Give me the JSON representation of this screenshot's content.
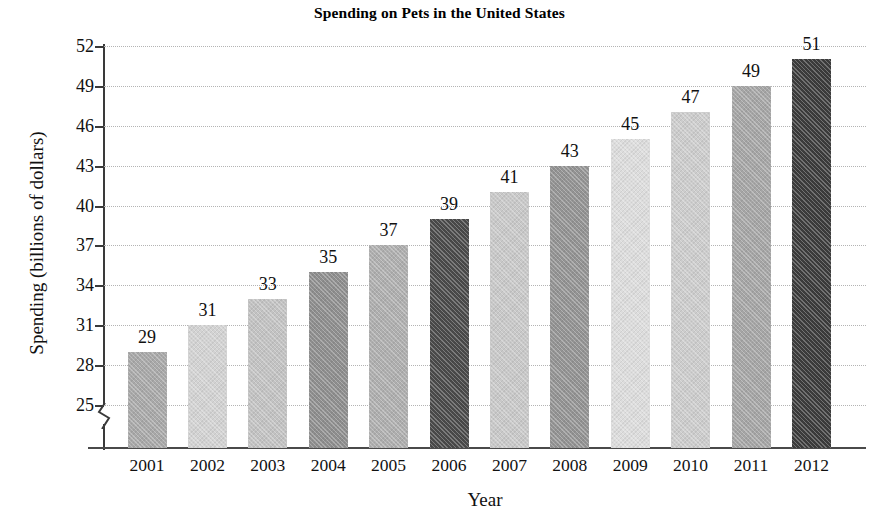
{
  "chart_data": {
    "type": "bar",
    "title": "Spending on Pets in the United States",
    "xlabel": "Year",
    "ylabel": "Spending (billions of dollars)",
    "categories": [
      "2001",
      "2002",
      "2003",
      "2004",
      "2005",
      "2006",
      "2007",
      "2008",
      "2009",
      "2010",
      "2011",
      "2012"
    ],
    "values": [
      29,
      31,
      33,
      35,
      37,
      39,
      41,
      43,
      45,
      47,
      49,
      51
    ],
    "value_labels": [
      "29",
      "31",
      "33",
      "35",
      "37",
      "39",
      "41",
      "43",
      "45",
      "47",
      "49",
      "51"
    ],
    "bar_colors": [
      "#a8a8a8",
      "#d2d2d2",
      "#c2c2c2",
      "#8e8e8e",
      "#aeaeae",
      "#4a4a4a",
      "#c8c8c8",
      "#939393",
      "#dcdcdc",
      "#cccccc",
      "#a5a5a5",
      "#3c3c3c"
    ],
    "ylim": [
      25,
      52
    ],
    "yticks": [
      25,
      28,
      31,
      34,
      37,
      40,
      43,
      46,
      49,
      52
    ],
    "ytick_labels": [
      "25",
      "28",
      "31",
      "34",
      "37",
      "40",
      "43",
      "46",
      "49",
      "52"
    ],
    "axis_break": true,
    "axis_break_note": "y-axis broken below 25",
    "grid": true,
    "grid_style": "dotted horizontal",
    "legend": "none",
    "gridline_color": "#b4b4b4",
    "axis_color": "#3a3a3a"
  }
}
